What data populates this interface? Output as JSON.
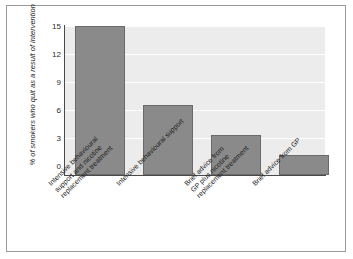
{
  "figure": {
    "background_color": "#ffffff",
    "frame_color": "#9a9a9a",
    "plot_background_color": "#ececec",
    "gridline_color": "#ffffff",
    "bar_fill_color": "#8a8a8a",
    "bar_border_color": "#6a6a6a",
    "axis_color": "#4a4a4a"
  },
  "chart_data": {
    "type": "bar",
    "title": "",
    "xlabel": "",
    "ylabel": "% of smokers who quit as a result of intervention",
    "ylim": [
      0,
      16
    ],
    "yticks": [
      0,
      3,
      6,
      9,
      12,
      15
    ],
    "ytick_labels": [
      "0",
      "3",
      "6",
      "9",
      "12",
      "15"
    ],
    "grid": true,
    "grid_axis": "y",
    "legend": false,
    "legend_position": "none",
    "categories": [
      "Intensive behavioural support and nicotine replacement treatment",
      "Intensive behavioural support",
      "Brief advice from GP plus nicotine replacement treatment",
      "Brief advice from GP"
    ],
    "category_label_lines": [
      [
        "Intensive behavioural",
        "support and nicotine",
        "replacement treatment"
      ],
      [
        "Intensive behavioural support"
      ],
      [
        "Brief advice from",
        "GP plus nicotine",
        "replacement treatment"
      ],
      [
        "Brief advice from GP"
      ]
    ],
    "values": [
      15,
      7,
      4,
      2
    ]
  }
}
